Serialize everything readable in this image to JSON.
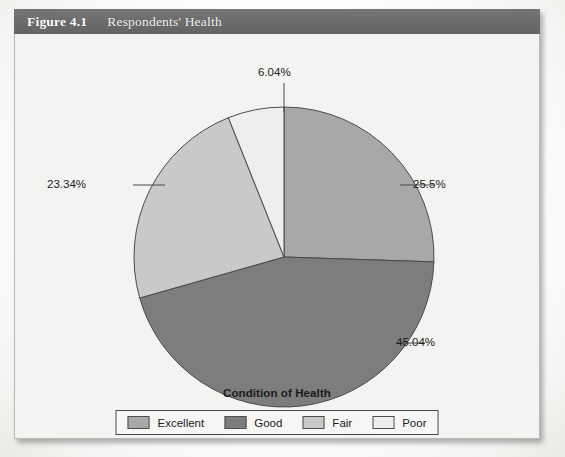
{
  "figure": {
    "number": "Figure 4.1",
    "caption": "Respondents' Health",
    "header_color": "#6b6b6b",
    "body_color": "#f3f3f1"
  },
  "chart_data": {
    "type": "pie",
    "title": "Respondents' Health",
    "xlabel": "Condition of Health",
    "ylabel": "",
    "legend_position": "bottom",
    "grid": false,
    "start_angle_deg": 0,
    "direction": "clockwise",
    "categories": [
      "Excellent",
      "Good",
      "Fair",
      "Poor"
    ],
    "values": [
      25.5,
      45.04,
      23.34,
      6.04
    ],
    "value_labels": [
      "25.5%",
      "45.04%",
      "23.34%",
      "6.04%"
    ],
    "colors": [
      "#a8a8a8",
      "#7d7d7d",
      "#c9c9c9",
      "#eeeeec"
    ],
    "slices": [
      {
        "label": "Excellent",
        "value": 25.5,
        "display": "25.5%",
        "color": "#a8a8a8"
      },
      {
        "label": "Good",
        "value": 45.04,
        "display": "45.04%",
        "color": "#7d7d7d"
      },
      {
        "label": "Fair",
        "value": 23.34,
        "display": "23.34%",
        "color": "#c9c9c9"
      },
      {
        "label": "Poor",
        "value": 6.04,
        "display": "6.04%",
        "color": "#eeeeec"
      }
    ]
  },
  "legend": {
    "items": [
      {
        "label": "Excellent",
        "color": "#a8a8a8"
      },
      {
        "label": "Good",
        "color": "#7d7d7d"
      },
      {
        "label": "Fair",
        "color": "#c9c9c9"
      },
      {
        "label": "Poor",
        "color": "#eeeeec"
      }
    ]
  }
}
